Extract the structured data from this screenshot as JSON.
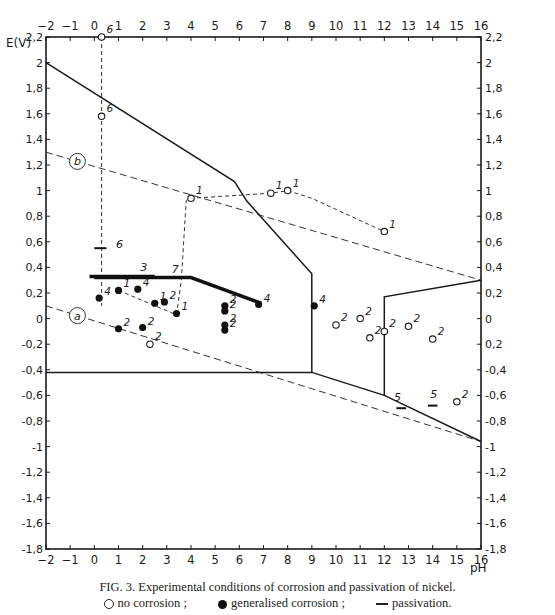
{
  "chart_data": {
    "type": "scatter",
    "title": "Experimental conditions of corrosion and passivation of nickel.",
    "figure_label": "FIG. 3.",
    "xlabel": "pH",
    "ylabel": "E(V)",
    "xlim": [
      -2,
      16
    ],
    "ylim": [
      -1.8,
      2.2
    ],
    "x_ticks": [
      -2,
      -1,
      0,
      1,
      2,
      3,
      4,
      5,
      6,
      7,
      8,
      9,
      10,
      11,
      12,
      13,
      14,
      15,
      16
    ],
    "y_ticks": [
      2.2,
      2,
      1.8,
      1.6,
      1.4,
      1.2,
      1,
      0.8,
      0.6,
      0.4,
      0.2,
      0,
      -0.2,
      -0.4,
      -0.6,
      -0.8,
      -1,
      -1.2,
      -1.4,
      -1.6,
      -1.8
    ],
    "y_tick_labels_left": [
      "2,2",
      "2",
      "1,8",
      "1,6",
      "1,4",
      "1,2",
      "1",
      "0,8",
      "0,6",
      "0,4",
      "0,2",
      "0",
      "-0,2",
      "-0,4",
      "-0,6",
      "-0,8",
      "-1",
      "-1,2",
      "-1,4",
      "-1,6",
      "-1,8"
    ],
    "y_tick_labels_right": [
      "2,2",
      "2",
      "1,8",
      "1,6",
      "1,4",
      "1,2",
      "1",
      "0,8",
      "0,6",
      "0,4",
      "0,2",
      "0",
      "0,2",
      "-0,4",
      "-0,6",
      "-0,8",
      "-1",
      "-1,2",
      "-1,4",
      "-1,6",
      "-1,8"
    ],
    "grid": false,
    "legend": [
      {
        "symbol": "open-circle",
        "label": "no corrosion ;"
      },
      {
        "symbol": "filled-circle",
        "label": "generalised corrosion ;"
      },
      {
        "symbol": "dash",
        "label": "passivation."
      }
    ],
    "boundary_lines": [
      {
        "name": "upper-stability-boundary",
        "style": "solid",
        "points": [
          [
            -2,
            2.0
          ],
          [
            5.8,
            1.07
          ],
          [
            6.3,
            0.92
          ],
          [
            9,
            0.35
          ],
          [
            9,
            -0.42
          ]
        ]
      },
      {
        "name": "lower-horizontal-boundary",
        "style": "solid",
        "points": [
          [
            -2,
            -0.42
          ],
          [
            9,
            -0.42
          ],
          [
            12,
            -0.6
          ],
          [
            16,
            -0.96
          ]
        ]
      },
      {
        "name": "right-domain-boundary",
        "style": "solid",
        "points": [
          [
            12,
            -0.6
          ],
          [
            12,
            0.17
          ],
          [
            16,
            0.3
          ]
        ]
      }
    ],
    "reference_lines": [
      {
        "label": "b",
        "style": "dashed",
        "points": [
          [
            -2,
            1.3
          ],
          [
            16,
            0.3
          ]
        ]
      },
      {
        "label": "a",
        "style": "dashed",
        "points": [
          [
            -2,
            0.1
          ],
          [
            16,
            -0.96
          ]
        ]
      }
    ],
    "experiment_paths": [
      {
        "series": "6",
        "style": "dashed",
        "points": [
          [
            0.3,
            2.2
          ],
          [
            0.3,
            0.1
          ]
        ]
      },
      {
        "series": "1",
        "style": "dashed",
        "points": [
          [
            3.4,
            0.03
          ],
          [
            3.6,
            0.3
          ],
          [
            3.8,
            0.92
          ],
          [
            4.0,
            0.94
          ],
          [
            7.3,
            0.98
          ],
          [
            8.0,
            1.0
          ],
          [
            9.0,
            0.94
          ],
          [
            12.0,
            0.68
          ]
        ]
      },
      {
        "series": "1-lower",
        "style": "dashed",
        "points": [
          [
            1.0,
            0.22
          ],
          [
            3.4,
            0.03
          ]
        ]
      }
    ],
    "passivation_bars": [
      {
        "label": "3",
        "points": [
          [
            -0.2,
            0.33
          ],
          [
            2.5,
            0.33
          ]
        ],
        "thick": true
      },
      {
        "label": "7",
        "points": [
          [
            0.0,
            0.32
          ],
          [
            4.0,
            0.32
          ],
          [
            6.9,
            0.12
          ]
        ],
        "thick": true
      },
      {
        "label": "6",
        "points": [
          [
            0.0,
            0.55
          ],
          [
            0.5,
            0.55
          ]
        ]
      },
      {
        "label": "5",
        "points": [
          [
            12.5,
            -0.7
          ],
          [
            12.9,
            -0.7
          ]
        ]
      },
      {
        "label": "5",
        "points": [
          [
            13.8,
            -0.68
          ],
          [
            14.2,
            -0.68
          ]
        ]
      }
    ],
    "points_no_corrosion": [
      {
        "pH": 0.3,
        "E": 2.2,
        "label": "6"
      },
      {
        "pH": 0.3,
        "E": 1.58,
        "label": "6"
      },
      {
        "pH": 4.0,
        "E": 0.94,
        "label": "1"
      },
      {
        "pH": 7.3,
        "E": 0.98,
        "label": "1"
      },
      {
        "pH": 8.0,
        "E": 1.0,
        "label": "1"
      },
      {
        "pH": 12.0,
        "E": 0.68,
        "label": "1"
      },
      {
        "pH": 2.3,
        "E": -0.2,
        "label": "2"
      },
      {
        "pH": 10.0,
        "E": -0.05,
        "label": "2"
      },
      {
        "pH": 11.0,
        "E": 0.0,
        "label": "2"
      },
      {
        "pH": 11.4,
        "E": -0.15,
        "label": "2"
      },
      {
        "pH": 12.0,
        "E": -0.1,
        "label": "2"
      },
      {
        "pH": 13.0,
        "E": -0.06,
        "label": "2"
      },
      {
        "pH": 14.0,
        "E": -0.16,
        "label": "2"
      },
      {
        "pH": 15.0,
        "E": -0.65,
        "label": "2"
      }
    ],
    "points_generalised_corrosion": [
      {
        "pH": 0.2,
        "E": 0.16,
        "label": "4"
      },
      {
        "pH": 1.0,
        "E": 0.22,
        "label": "1"
      },
      {
        "pH": 1.8,
        "E": 0.23,
        "label": "4"
      },
      {
        "pH": 2.5,
        "E": 0.12,
        "label": "1"
      },
      {
        "pH": 2.9,
        "E": 0.13,
        "label": "2"
      },
      {
        "pH": 3.4,
        "E": 0.04,
        "label": "1"
      },
      {
        "pH": 1.0,
        "E": -0.08,
        "label": "2"
      },
      {
        "pH": 2.0,
        "E": -0.07,
        "label": "2"
      },
      {
        "pH": 5.4,
        "E": 0.1,
        "label": "2"
      },
      {
        "pH": 5.4,
        "E": 0.06,
        "label": "2"
      },
      {
        "pH": 5.4,
        "E": -0.05,
        "label": "2"
      },
      {
        "pH": 5.4,
        "E": -0.09,
        "label": "2"
      },
      {
        "pH": 6.8,
        "E": 0.11,
        "label": "4"
      },
      {
        "pH": 9.1,
        "E": 0.1,
        "label": "4"
      }
    ]
  },
  "axis": {
    "ylabel": "E(V)",
    "xlabel": "pH",
    "label_a": "a",
    "label_b": "b"
  },
  "caption": {
    "title": "FIG. 3. Experimental conditions of corrosion and passivation of nickel.",
    "legend_open": "no corrosion ;",
    "legend_filled": "generalised corrosion ;",
    "legend_dash": "passivation."
  }
}
